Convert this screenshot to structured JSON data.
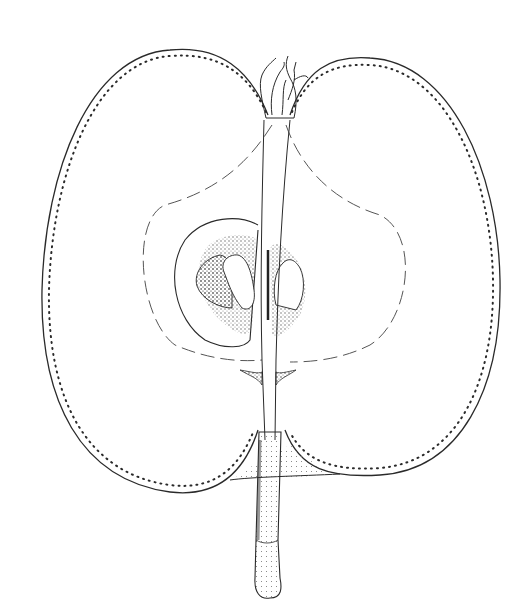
{
  "image": {
    "subject": "Longitudinal cross-section of a pear fruit, botanical pen-and-ink illustration",
    "background_color": "#ffffff",
    "ink_color": "#2a2a2a",
    "parts": [
      "skin-outline",
      "calyx",
      "core-line",
      "seed-cavity",
      "seeds",
      "central-vascular-strand",
      "stem"
    ]
  }
}
